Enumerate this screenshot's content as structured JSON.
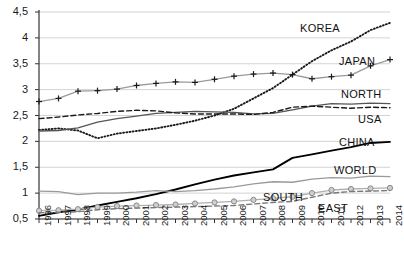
{
  "chart_data": {
    "type": "line",
    "title": "",
    "xlabel": "",
    "ylabel": "",
    "grid": true,
    "legend_position": "inline-right-labels",
    "x": [
      1996,
      1997,
      1998,
      1999,
      2000,
      2001,
      2002,
      2003,
      2004,
      2005,
      2006,
      2007,
      2008,
      2009,
      2010,
      2011,
      2012,
      2013,
      2014
    ],
    "xtick_labels": [
      "1996",
      "1997",
      "1998",
      "1999",
      "2000",
      "2001",
      "2002",
      "2003",
      "2004",
      "2005",
      "2006",
      "2007",
      "2008",
      "2009",
      "2010",
      "2011",
      "2012",
      "2013",
      "2014"
    ],
    "ytick_labels": [
      "0,5",
      "1",
      "1,5",
      "2",
      "2,5",
      "3",
      "3,5",
      "4",
      "4,5"
    ],
    "ytick_values": [
      0.5,
      1,
      1.5,
      2,
      2.5,
      3,
      3.5,
      4,
      4.5
    ],
    "ylim": [
      0.5,
      4.5
    ],
    "xlim": [
      1996,
      2014
    ],
    "series": [
      {
        "name": "KOREA",
        "style": "dotted",
        "color": "#1a1a1a",
        "marker": "none",
        "label_x": 1.0,
        "values": [
          2.22,
          2.25,
          2.21,
          2.06,
          2.15,
          2.2,
          2.25,
          2.32,
          2.4,
          2.5,
          2.63,
          2.83,
          3.03,
          3.29,
          3.55,
          3.76,
          3.93,
          4.15,
          4.29
        ]
      },
      {
        "name": "JAPAN",
        "style": "solid",
        "color": "#9a9a9a",
        "marker": "plus",
        "marker_color": "#1a1a1a",
        "values": [
          2.77,
          2.83,
          2.97,
          2.98,
          3.01,
          3.08,
          3.12,
          3.15,
          3.14,
          3.2,
          3.26,
          3.3,
          3.32,
          3.29,
          3.21,
          3.25,
          3.28,
          3.46,
          3.58
        ]
      },
      {
        "name": "NORTH",
        "style": "solid",
        "color": "#555555",
        "marker": "none",
        "values": [
          2.2,
          2.21,
          2.26,
          2.37,
          2.44,
          2.49,
          2.54,
          2.56,
          2.58,
          2.57,
          2.56,
          2.53,
          2.54,
          2.61,
          2.68,
          2.73,
          2.72,
          2.74,
          2.73
        ]
      },
      {
        "name": "USA",
        "style": "dashed",
        "color": "#1a1a1a",
        "marker": "none",
        "values": [
          2.44,
          2.47,
          2.51,
          2.54,
          2.58,
          2.6,
          2.59,
          2.55,
          2.53,
          2.53,
          2.53,
          2.52,
          2.56,
          2.66,
          2.68,
          2.66,
          2.64,
          2.66,
          2.65
        ]
      },
      {
        "name": "CHINA",
        "style": "solid",
        "color": "#000000",
        "marker": "none",
        "values": [
          0.56,
          0.63,
          0.68,
          0.76,
          0.83,
          0.9,
          0.98,
          1.07,
          1.17,
          1.26,
          1.34,
          1.4,
          1.46,
          1.68,
          1.75,
          1.82,
          1.89,
          1.97,
          1.99
        ]
      },
      {
        "name": "WORLD",
        "style": "solid",
        "color": "#9a9a9a",
        "marker": "none",
        "values": [
          1.04,
          1.03,
          0.97,
          1.0,
          1.0,
          1.02,
          1.05,
          1.03,
          1.05,
          1.08,
          1.12,
          1.18,
          1.22,
          1.21,
          1.27,
          1.3,
          1.29,
          1.33,
          1.32
        ]
      },
      {
        "name": "SOUTH",
        "style": "solid",
        "color": "#b0b0b0",
        "marker": "circle",
        "values": [
          0.66,
          0.67,
          0.69,
          0.73,
          0.75,
          0.76,
          0.77,
          0.78,
          0.8,
          0.82,
          0.84,
          0.87,
          0.9,
          0.93,
          1.0,
          1.06,
          1.08,
          1.09,
          1.1
        ]
      },
      {
        "name": "EAST",
        "style": "dashed",
        "color": "#7a7a7a",
        "marker": "none",
        "values": [
          0.62,
          0.63,
          0.64,
          0.68,
          0.7,
          0.71,
          0.72,
          0.73,
          0.74,
          0.75,
          0.76,
          0.79,
          0.82,
          0.84,
          0.92,
          1.0,
          1.03,
          1.04,
          1.05
        ]
      }
    ],
    "inline_labels": [
      {
        "text": "KOREA",
        "x": 300,
        "y": 22
      },
      {
        "text": "JAPAN",
        "x": 339,
        "y": 55
      },
      {
        "text": "NORTH",
        "x": 341,
        "y": 88
      },
      {
        "text": "USA",
        "x": 358,
        "y": 113
      },
      {
        "text": "CHINA",
        "x": 339,
        "y": 136
      },
      {
        "text": "WORLD",
        "x": 334,
        "y": 164
      },
      {
        "text": "SOUTH",
        "x": 263,
        "y": 191
      },
      {
        "text": "EAST",
        "x": 318,
        "y": 202
      }
    ]
  }
}
